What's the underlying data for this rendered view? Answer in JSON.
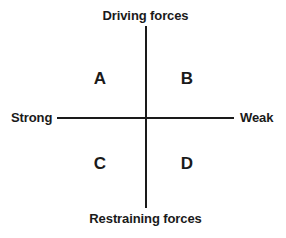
{
  "diagram": {
    "type": "two-by-two-quadrant-matrix",
    "axes": {
      "vertical": {
        "top_label": "Driving forces",
        "bottom_label": "Restraining forces"
      },
      "horizontal": {
        "left_label": "Strong",
        "right_label": "Weak"
      }
    },
    "quadrants": [
      {
        "id": "a",
        "label": "A",
        "position": "top-left"
      },
      {
        "id": "b",
        "label": "B",
        "position": "top-right"
      },
      {
        "id": "c",
        "label": "C",
        "position": "bottom-left"
      },
      {
        "id": "d",
        "label": "D",
        "position": "bottom-right"
      }
    ],
    "colors": {
      "line": "#1a1a1a",
      "text": "#1a1a1a",
      "background": "#ffffff"
    }
  }
}
